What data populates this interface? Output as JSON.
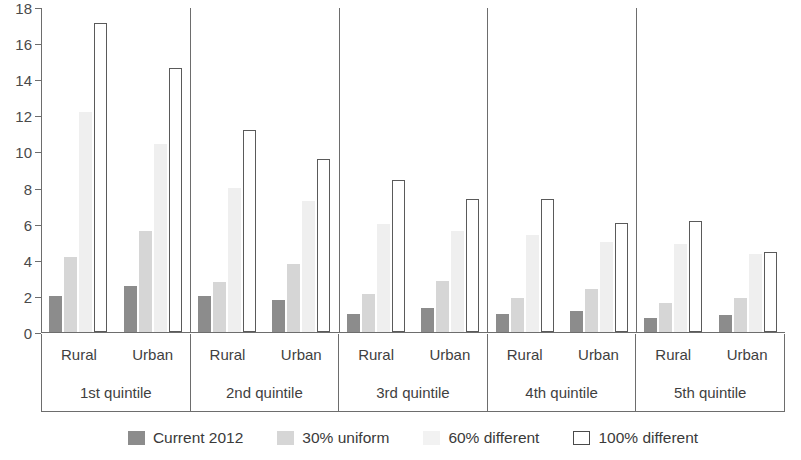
{
  "chart_data": {
    "type": "bar",
    "title": "",
    "subtitle": "",
    "xlabel": "",
    "ylabel": "",
    "ylim": [
      0,
      18
    ],
    "ytick_step": 2,
    "yticks": [
      0,
      2,
      4,
      6,
      8,
      10,
      12,
      14,
      16,
      18
    ],
    "grid": false,
    "legend_position": "bottom",
    "categories": [
      "1st quintile Rural",
      "1st quintile Urban",
      "2nd quintile Rural",
      "2nd quintile Urban",
      "3rd quintile Rural",
      "3rd quintile Urban",
      "4th quintile Rural",
      "4th quintile Urban",
      "5th quintile Rural",
      "5th quintile Urban"
    ],
    "group_labels": [
      "1st quintile",
      "2nd quintile",
      "3rd quintile",
      "4th quintile",
      "5th quintile"
    ],
    "subgroup_labels": [
      "Rural",
      "Urban"
    ],
    "series": [
      {
        "name": "Current 2012",
        "color": "#8c8c8c",
        "values": [
          2.0,
          2.55,
          2.0,
          1.8,
          1.0,
          1.35,
          1.0,
          1.15,
          0.8,
          0.95
        ]
      },
      {
        "name": "30% uniform",
        "color": "#d6d6d6",
        "values": [
          4.15,
          5.6,
          2.75,
          3.75,
          2.1,
          2.85,
          1.9,
          2.4,
          1.6,
          1.9
        ]
      },
      {
        "name": "60% different",
        "color": "#efefef",
        "values": [
          12.2,
          10.4,
          7.95,
          7.25,
          6.0,
          5.6,
          5.35,
          5.0,
          4.85,
          4.3
        ]
      },
      {
        "name": "100% different",
        "color": "#ffffff",
        "values": [
          17.1,
          14.65,
          11.2,
          9.6,
          8.4,
          7.35,
          7.35,
          6.05,
          6.15,
          4.45
        ]
      }
    ]
  },
  "axis": {
    "y_tick_labels": [
      "18",
      "16",
      "14",
      "12",
      "10",
      "8",
      "6",
      "4",
      "2",
      "0"
    ]
  },
  "legend": {
    "items": [
      {
        "label": "Current 2012",
        "swatch": "filled-dark-gray-swatch"
      },
      {
        "label": "30% uniform",
        "swatch": "filled-light-gray-swatch"
      },
      {
        "label": "60% different",
        "swatch": "filled-very-light-gray-swatch"
      },
      {
        "label": "100% different",
        "swatch": "outlined-white-swatch"
      }
    ]
  }
}
